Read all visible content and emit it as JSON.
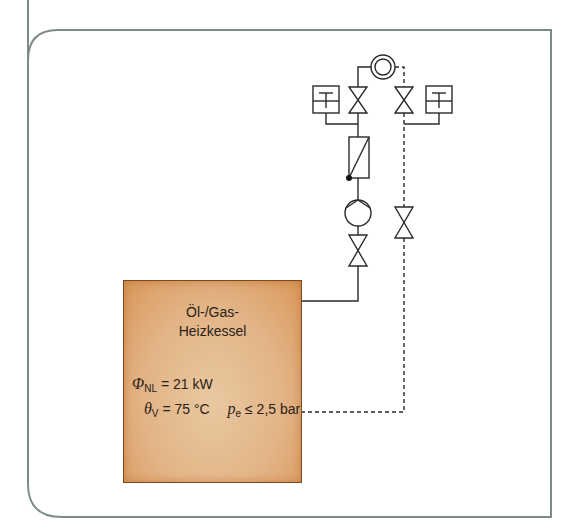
{
  "boiler": {
    "title_line1": "Öl-/Gas-",
    "title_line2": "Heizkessel",
    "fill_color": "#e2b487",
    "edge_color": "#d9975a"
  },
  "parameters": {
    "phi_symbol": "Φ",
    "phi_sub": "NL",
    "phi_value": "= 21 kW",
    "theta_symbol": "θ",
    "theta_sub": "V",
    "theta_value": "= 75 °C",
    "p_symbol": "p",
    "p_sub": "e",
    "p_value": "≤ 2,5 bar"
  },
  "symbols": {
    "thermometer_left": "thermometer",
    "thermometer_right": "thermometer",
    "valve_flow_top": "shutoff-valve",
    "valve_return_top": "shutoff-valve",
    "filter": "filter",
    "pump": "circulation-pump",
    "valve_flow_bottom": "shutoff-valve",
    "valve_return_bottom": "shutoff-valve",
    "consumer": "heat-consumer"
  },
  "line_color": "#2a2a2a",
  "frame_color": "#7f8a86"
}
